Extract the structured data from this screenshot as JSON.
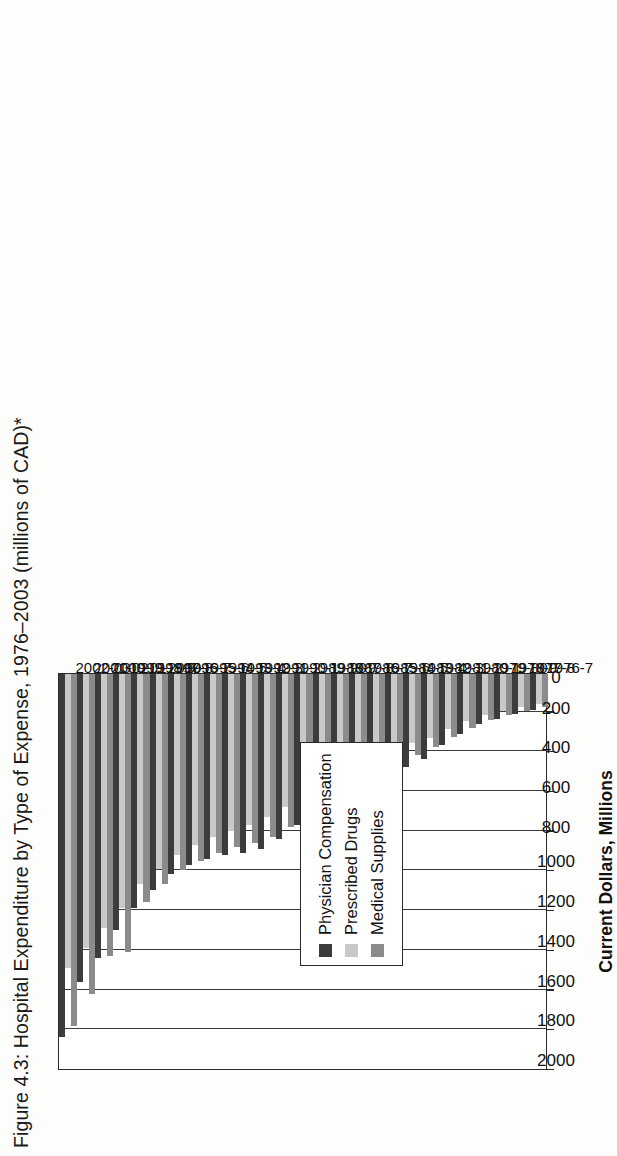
{
  "figure": {
    "title": "Figure 4.3: Hospital Expenditure by Type of Expense, 1976–2003 (millions of CAD)*"
  },
  "legend": {
    "items": [
      {
        "label": "Physician Compensation",
        "color": "#3c3c3c"
      },
      {
        "label": "Prescribed Drugs",
        "color": "#c9c9c9"
      },
      {
        "label": "Medical Supplies",
        "color": "#8b8b8b"
      }
    ]
  },
  "chart_data": {
    "type": "bar",
    "orientation": "horizontal",
    "title": "Figure 4.3: Hospital Expenditure by Type of Expense, 1976–2003 (millions of CAD)*",
    "xlabel": "",
    "ylabel": "Current Dollars, Millions",
    "ylim": [
      0,
      2000
    ],
    "tick_labels": [
      "2000",
      "1800",
      "1600",
      "1400",
      "1200",
      "1000",
      "800",
      "600",
      "400",
      "200",
      "0"
    ],
    "ticks": [
      2000,
      1800,
      1600,
      1400,
      1200,
      1000,
      800,
      600,
      400,
      200,
      0
    ],
    "grid": true,
    "legend_position": "inside-left",
    "categories": [
      "1976-7",
      "1977-8",
      "1978-9",
      "1979-80",
      "1980-1",
      "1981-2",
      "1982-3",
      "1983-4",
      "1984-5",
      "1985-6",
      "1986-7",
      "1987-8",
      "1988-9",
      "1989-90",
      "1990-1",
      "1991-2",
      "1992-3",
      "1993-4",
      "1994-5",
      "1995-6",
      "1996-7",
      "1997-8",
      "1998-9",
      "1999-2000",
      "2000-01",
      "2001-02",
      "2002-03"
    ],
    "series": [
      {
        "name": "Physician Compensation",
        "color": "#3c3c3c",
        "values": [
          180,
          200,
          225,
          250,
          300,
          360,
          430,
          470,
          510,
          560,
          600,
          640,
          700,
          760,
          830,
          880,
          900,
          910,
          930,
          960,
          1010,
          1090,
          1180,
          1290,
          1430,
          1550,
          1830
        ]
      },
      {
        "name": "Prescribed Drugs",
        "color": "#c9c9c9",
        "values": [
          150,
          165,
          185,
          205,
          235,
          275,
          320,
          350,
          390,
          430,
          470,
          510,
          560,
          610,
          670,
          720,
          760,
          790,
          820,
          860,
          910,
          980,
          1060,
          1180,
          1280,
          1380,
          1480
        ]
      },
      {
        "name": "Medical Supplies",
        "color": "#8b8b8b",
        "values": [
          165,
          185,
          205,
          230,
          270,
          315,
          370,
          410,
          450,
          500,
          540,
          590,
          640,
          700,
          770,
          820,
          850,
          870,
          900,
          940,
          990,
          1060,
          1150,
          1400,
          1420,
          1610,
          1775
        ]
      }
    ]
  }
}
